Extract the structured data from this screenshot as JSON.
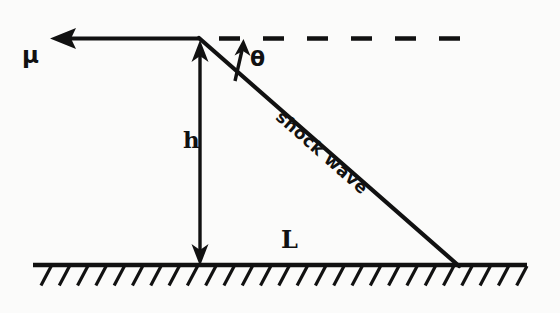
{
  "figure": {
    "kind": "hand-drawn-physics-diagram",
    "background_color": "#fbfbfa",
    "ink_color": "#111111",
    "width": 560,
    "height": 313
  },
  "labels": {
    "velocity": "μ",
    "angle": "θ",
    "height": "h",
    "length": "L",
    "shock_wave": "shock wave"
  },
  "geometry": {
    "apex": {
      "x": 200,
      "y": 38
    },
    "ground_y": 265,
    "ground_x_start": 33,
    "ground_x_end": 527,
    "shock_ground_intersection": {
      "x": 458,
      "y": 265
    },
    "flow_arrow": {
      "x_tail": 200,
      "y": 38,
      "x_head": 50,
      "y_head": 38
    },
    "dashed_line": {
      "x_start": 218,
      "x_end": 477,
      "y": 38
    },
    "height_arrow": {
      "x": 200,
      "y_top": 44,
      "y_bottom": 265
    },
    "theta_arrow": {
      "x_base": 236,
      "y_base": 80,
      "x_head": 243,
      "y_head": 41
    },
    "hatch_count": 27,
    "hatch_spacing": 19,
    "hatch_length": 22,
    "hatch_angle_deg": 62
  },
  "chart_data": {
    "type": "diagram",
    "elements": [
      {
        "name": "flow-velocity-arrow",
        "label": "μ",
        "direction": "left",
        "from": [
          200,
          38
        ],
        "to": [
          50,
          38
        ]
      },
      {
        "name": "dashed-reference-line",
        "label": "",
        "from": [
          218,
          38
        ],
        "to": [
          477,
          38
        ]
      },
      {
        "name": "shock-wave-line",
        "label": "shock wave",
        "from": [
          200,
          38
        ],
        "to": [
          458,
          265
        ]
      },
      {
        "name": "shock-angle",
        "label": "θ",
        "between": [
          "shock-wave-line",
          "dashed-reference-line"
        ],
        "vertex": [
          200,
          38
        ]
      },
      {
        "name": "height-dimension",
        "label": "h",
        "from": [
          200,
          265
        ],
        "to": [
          200,
          38
        ]
      },
      {
        "name": "length-dimension",
        "label": "L",
        "from": [
          200,
          265
        ],
        "to": [
          458,
          265
        ]
      },
      {
        "name": "ground-line",
        "label": "",
        "from": [
          33,
          265
        ],
        "to": [
          527,
          265
        ]
      }
    ]
  }
}
